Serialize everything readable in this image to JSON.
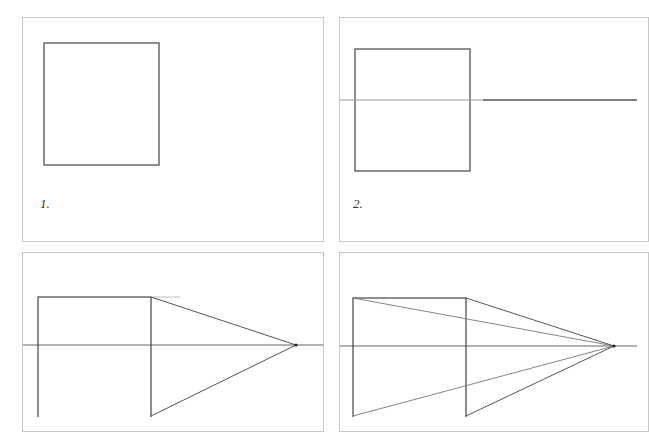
{
  "figure": {
    "colors": {
      "panel_border": "#c8c8c8",
      "stroke": "#444444",
      "guide": "#888888"
    },
    "panels": [
      {
        "step": 1,
        "label": "1.",
        "content": "square"
      },
      {
        "step": 2,
        "label": "2.",
        "content": "square with horizon line"
      },
      {
        "step": 3,
        "label": "",
        "content": "square with lines from right corners to vanishing point"
      },
      {
        "step": 4,
        "label": "",
        "content": "square with lines from all corners to vanishing point"
      }
    ]
  }
}
